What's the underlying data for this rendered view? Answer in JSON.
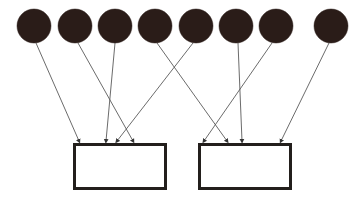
{
  "diagram": {
    "type": "node-to-box-arrow-diagram",
    "canvas": {
      "width": 364,
      "height": 207,
      "background": "#ffffff"
    },
    "style": {
      "node_fill": "#2a1c18",
      "node_stroke": "#2a1c18",
      "edge_color": "#5a5a5a",
      "edge_width": 0.9,
      "arrowhead_color": "#333333",
      "box_fill": "#ffffff",
      "box_stroke": "#231f1c",
      "box_stroke_width": 3
    },
    "nodes": [
      {
        "id": "n1",
        "label": "",
        "cx": 34,
        "cy": 26,
        "r": 17
      },
      {
        "id": "n2",
        "label": "",
        "cx": 75,
        "cy": 26,
        "r": 17
      },
      {
        "id": "n3",
        "label": "",
        "cx": 115,
        "cy": 26,
        "r": 17
      },
      {
        "id": "n4",
        "label": "",
        "cx": 155,
        "cy": 26,
        "r": 17
      },
      {
        "id": "n5",
        "label": "",
        "cx": 196,
        "cy": 26,
        "r": 17
      },
      {
        "id": "n6",
        "label": "",
        "cx": 236,
        "cy": 26,
        "r": 17
      },
      {
        "id": "n7",
        "label": "",
        "cx": 276,
        "cy": 26,
        "r": 17
      },
      {
        "id": "n8",
        "label": "",
        "cx": 331,
        "cy": 26,
        "r": 17
      }
    ],
    "boxes": [
      {
        "id": "b1",
        "label": "",
        "x": 73,
        "y": 143,
        "width": 94,
        "height": 47
      },
      {
        "id": "b2",
        "label": "",
        "x": 198,
        "y": 143,
        "width": 94,
        "height": 47
      }
    ],
    "edges": [
      {
        "id": "e1",
        "from": "n1",
        "to": "b1",
        "x1": 36,
        "y1": 43,
        "x2": 79,
        "y2": 141
      },
      {
        "id": "e2",
        "from": "n2",
        "to": "b1",
        "x1": 78,
        "y1": 43,
        "x2": 133,
        "y2": 141
      },
      {
        "id": "e3",
        "from": "n3",
        "to": "b1",
        "x1": 115,
        "y1": 43,
        "x2": 106,
        "y2": 141
      },
      {
        "id": "e4",
        "from": "n4",
        "to": "b2",
        "x1": 157,
        "y1": 43,
        "x2": 227,
        "y2": 141
      },
      {
        "id": "e5",
        "from": "n5",
        "to": "b1",
        "x1": 193,
        "y1": 43,
        "x2": 117,
        "y2": 141
      },
      {
        "id": "e6",
        "from": "n6",
        "to": "b2",
        "x1": 238,
        "y1": 43,
        "x2": 242,
        "y2": 141
      },
      {
        "id": "e7",
        "from": "n7",
        "to": "b2",
        "x1": 272,
        "y1": 43,
        "x2": 204,
        "y2": 141
      },
      {
        "id": "e8",
        "from": "n8",
        "to": "b2",
        "x1": 329,
        "y1": 43,
        "x2": 281,
        "y2": 141
      }
    ],
    "counts": {
      "nodes": 8,
      "boxes": 2,
      "edges": 8
    }
  }
}
